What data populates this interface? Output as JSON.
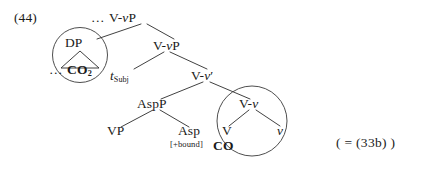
{
  "figure": {
    "example_number": "(44)",
    "cross_reference": "( = (33b) )"
  },
  "tree": {
    "root": {
      "label_prefix": "…",
      "label": "V-vP",
      "label_plain": "… V-vP"
    },
    "nodes": {
      "dp": "DP",
      "dp_complement": "… CO",
      "dp_complement_subscript": "2",
      "vp_shell": "V-vP",
      "trace_subject_base": "t",
      "trace_subject_sub": "Subj",
      "v_bar": "V-v′",
      "aspp": "AspP",
      "vp": "VP",
      "asp": "Asp",
      "asp_feature": "[+bound]",
      "v_small_head": "V-v",
      "verb": "V",
      "verb_root": "CO",
      "little_v": "v"
    },
    "circled": [
      {
        "name": "dp-constituent",
        "label": "DP"
      },
      {
        "name": "v-v-constituent",
        "label": "V-v"
      }
    ]
  },
  "colors": {
    "ink": "#1a1a1a",
    "stroke": "#2b2b2b",
    "circle_stroke": "#3a3a3a",
    "background": "#ffffff"
  }
}
